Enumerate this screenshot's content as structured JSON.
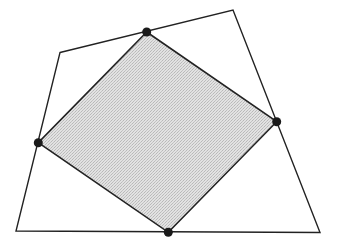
{
  "diagram": {
    "type": "quadrilateral-with-inscribed-quadrilateral",
    "outer_quadrilateral": {
      "vertices": [
        [
          60,
          52.5
        ],
        [
          233,
          10
        ],
        [
          320,
          232.5
        ],
        [
          16,
          231
        ]
      ],
      "stroke": "#222222",
      "fill": "none"
    },
    "inner_quadrilateral": {
      "vertices": [
        [
          146.7,
          32
        ],
        [
          276.7,
          121.7
        ],
        [
          168.3,
          232.3
        ],
        [
          38.3,
          142.7
        ]
      ],
      "stroke": "#222222",
      "fill": "#d6d6d6"
    },
    "points": [
      {
        "name": "top",
        "x": 146.7,
        "y": 32
      },
      {
        "name": "right",
        "x": 276.7,
        "y": 121.7
      },
      {
        "name": "bottom",
        "x": 168.3,
        "y": 232.3
      },
      {
        "name": "left",
        "x": 38.3,
        "y": 142.7
      }
    ],
    "point_color": "#1a1a1a",
    "point_radius": 4.5
  }
}
